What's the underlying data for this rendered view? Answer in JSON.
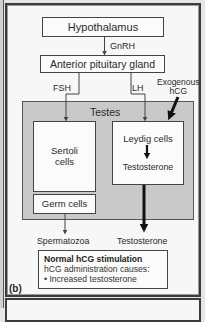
{
  "figure": {
    "panel_label": "(b)",
    "nodes": {
      "hypothalamus": "Hypothalamus",
      "anterior_pituitary": "Anterior pituitary gland",
      "testes": "Testes",
      "sertoli": "Sertoli cells",
      "leydig": "Leydig cells",
      "leydig_product": "Testosterone",
      "germ_cells": "Germ cells"
    },
    "edges": {
      "gnrh": "GnRH",
      "fsh": "FSH",
      "lh": "LH",
      "exogenous_hcg_line1": "Exogenous",
      "exogenous_hcg_line2": "hCG"
    },
    "outputs": {
      "spermatozoa": "Spermatozoa",
      "testosterone": "Testosterone"
    },
    "info_box": {
      "title": "Normal hCG stimulation",
      "subtitle": "hCG administration causes:",
      "bullet": "• Increased testosterone"
    }
  },
  "colors": {
    "background": "#f7f7f7",
    "testes_fill": "#c9c9c9",
    "stroke": "#444444"
  }
}
